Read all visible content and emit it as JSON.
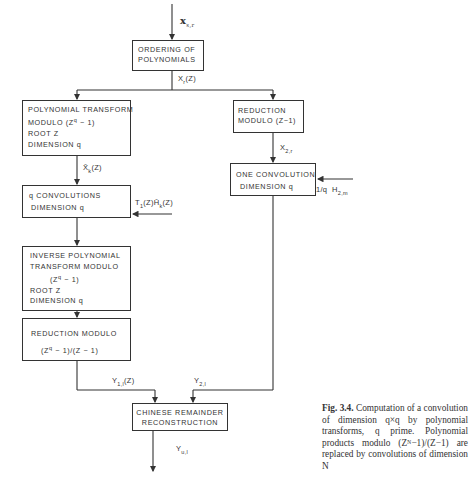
{
  "diagram": {
    "input_label": "x",
    "input_sub": "s,r",
    "nodes": {
      "ordering": {
        "lines": [
          "ORDERING OF",
          "POLYNOMIALS"
        ]
      },
      "poly_transform": {
        "lines": [
          "POLYNOMIAL TRANSFORM",
          "MODULO (Z",
          "q",
          " − 1)",
          "ROOT Z",
          "DIMENSION q"
        ]
      },
      "reduction_right": {
        "lines": [
          "REDUCTION",
          "MODULO (Z−1)"
        ]
      },
      "q_convolutions": {
        "lines": [
          "q CONVOLUTIONS",
          "DIMENSION q"
        ]
      },
      "one_convolution": {
        "lines": [
          "ONE CONVOLUTION",
          "DIMENSION q"
        ]
      },
      "inverse_transform": {
        "lines": [
          "INVERSE POLYNOMIAL",
          "TRANSFORM MODULO",
          "(Z",
          "q",
          " − 1)",
          "ROOT Z",
          "DIMENSION q"
        ]
      },
      "reduction_left": {
        "lines": [
          "REDUCTION MODULO",
          "(Z",
          "q",
          " − 1)/(Z − 1)"
        ]
      },
      "crt": {
        "lines": [
          "CHINESE REMAINDER",
          "RECONSTRUCTION"
        ]
      }
    },
    "edge_labels": {
      "xr": {
        "main": "X",
        "sub": "r",
        "tail": "(Z)"
      },
      "xk": {
        "main": "X̄",
        "sub": "k",
        "tail": "(Z)"
      },
      "t1h": {
        "main": "T",
        "sub1": "1",
        "mid": "(Z)H̄",
        "sub2": "k",
        "tail": "(Z)"
      },
      "x2r": {
        "main": "X",
        "sub": "2,r"
      },
      "h2m": {
        "main": "1/q  H",
        "sub": "2,m"
      },
      "y1": {
        "main": "Y",
        "sub": "1,l",
        "tail": "(Z)"
      },
      "y2": {
        "main": "Y",
        "sub": "2,l"
      },
      "yu": {
        "main": "Y",
        "sub": "u,l"
      }
    }
  },
  "caption": {
    "label": "Fig. 3.4.",
    "text": "Computation of a convolution of dimension q×q by polynomial transforms, q prime. Polynomial products modulo (Zᴺ−1)/(Z−1) are replaced by convolutions of dimension N"
  }
}
